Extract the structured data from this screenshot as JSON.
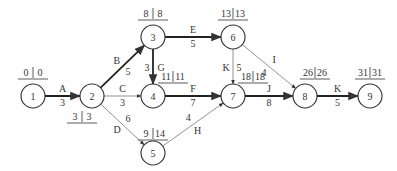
{
  "diagram": {
    "type": "activity-on-arrow network (CPM)",
    "nodes": [
      {
        "id": "1",
        "label": "1",
        "x": 33,
        "y": 96,
        "es": "0",
        "ls": "0",
        "tx": 33,
        "ty": 76
      },
      {
        "id": "2",
        "label": "2",
        "x": 92,
        "y": 96,
        "es": "3",
        "ls": "3",
        "tx": 82,
        "ty": 120
      },
      {
        "id": "3",
        "label": "3",
        "x": 153,
        "y": 37,
        "es": "8",
        "ls": "8",
        "tx": 153,
        "ty": 17
      },
      {
        "id": "4",
        "label": "4",
        "x": 153,
        "y": 96,
        "es": "11",
        "ls": "11",
        "tx": 173,
        "ty": 80
      },
      {
        "id": "5",
        "label": "5",
        "x": 153,
        "y": 153,
        "es": "9",
        "ls": "14",
        "tx": 153,
        "ty": 137
      },
      {
        "id": "6",
        "label": "6",
        "x": 233,
        "y": 37,
        "es": "13",
        "ls": "13",
        "tx": 233,
        "ty": 17
      },
      {
        "id": "7",
        "label": "7",
        "x": 233,
        "y": 96,
        "es": "18",
        "ls": "18",
        "tx": 253,
        "ty": 80
      },
      {
        "id": "8",
        "label": "8",
        "x": 305,
        "y": 96,
        "es": "26",
        "ls": "26",
        "tx": 315,
        "ty": 76
      },
      {
        "id": "9",
        "label": "9",
        "x": 370,
        "y": 96,
        "es": "31",
        "ls": "31",
        "tx": 370,
        "ty": 76
      }
    ],
    "edges": [
      {
        "from": "1",
        "to": "2",
        "activity": "A",
        "duration": "3",
        "critical": true
      },
      {
        "from": "2",
        "to": "3",
        "activity": "B",
        "duration": "5",
        "critical": true
      },
      {
        "from": "2",
        "to": "4",
        "activity": "C",
        "duration": "3",
        "critical": false
      },
      {
        "from": "2",
        "to": "5",
        "activity": "D",
        "duration": "6",
        "critical": false
      },
      {
        "from": "3",
        "to": "6",
        "activity": "E",
        "duration": "5",
        "critical": true
      },
      {
        "from": "3",
        "to": "4",
        "activity": "G",
        "duration": "3",
        "critical": true
      },
      {
        "from": "4",
        "to": "7",
        "activity": "F",
        "duration": "7",
        "critical": true
      },
      {
        "from": "5",
        "to": "7",
        "activity": "H",
        "duration": "4",
        "critical": false
      },
      {
        "from": "6",
        "to": "7",
        "activity": "K",
        "duration": "5",
        "critical": false
      },
      {
        "from": "6",
        "to": "8",
        "activity": "I",
        "duration": "4",
        "critical": false
      },
      {
        "from": "7",
        "to": "8",
        "activity": "J",
        "duration": "8",
        "critical": true
      },
      {
        "from": "8",
        "to": "9",
        "activity": "K",
        "duration": "5",
        "critical": true
      }
    ]
  }
}
